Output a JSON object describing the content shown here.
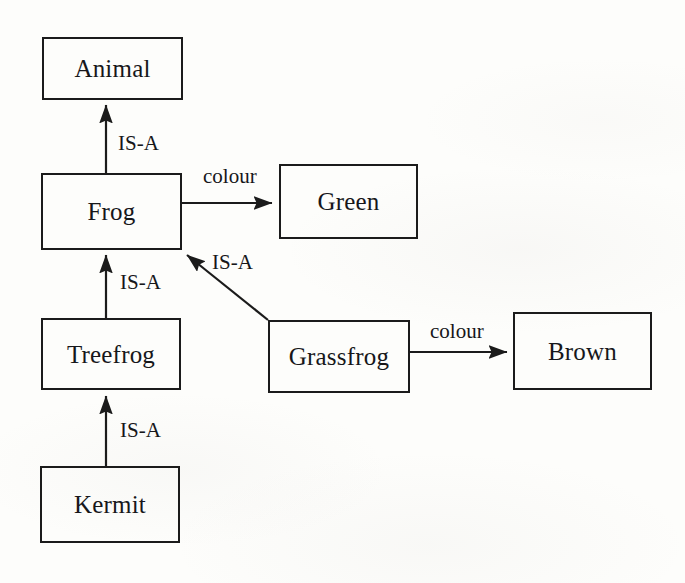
{
  "diagram": {
    "kind": "semantic-network",
    "background_color": "#fdfdfb",
    "line_color": "#1b1b1b",
    "text_color": "#17171a",
    "nodes": [
      {
        "id": "animal",
        "label": "Animal",
        "x": 42,
        "y": 37,
        "w": 141,
        "h": 63
      },
      {
        "id": "frog",
        "label": "Frog",
        "x": 41,
        "y": 173,
        "w": 141,
        "h": 77
      },
      {
        "id": "green",
        "label": "Green",
        "x": 279,
        "y": 164,
        "w": 139,
        "h": 75
      },
      {
        "id": "treefrog",
        "label": "Treefrog",
        "x": 41,
        "y": 318,
        "w": 140,
        "h": 72
      },
      {
        "id": "grassfrog",
        "label": "Grassfrog",
        "x": 268,
        "y": 320,
        "w": 142,
        "h": 73
      },
      {
        "id": "brown",
        "label": "Brown",
        "x": 513,
        "y": 312,
        "w": 139,
        "h": 78
      },
      {
        "id": "kermit",
        "label": "Kermit",
        "x": 40,
        "y": 466,
        "w": 140,
        "h": 77
      }
    ],
    "edges": [
      {
        "id": "frog-isa-animal",
        "from": "frog",
        "to": "animal",
        "label": "IS-A",
        "label_x": 118,
        "label_y": 133
      },
      {
        "id": "treefrog-isa-frog",
        "from": "treefrog",
        "to": "frog",
        "label": "IS-A",
        "label_x": 120,
        "label_y": 272
      },
      {
        "id": "kermit-isa-treefrog",
        "from": "kermit",
        "to": "treefrog",
        "label": "IS-A",
        "label_x": 120,
        "label_y": 420
      },
      {
        "id": "grassfrog-isa-frog",
        "from": "grassfrog",
        "to": "frog",
        "label": "IS-A",
        "label_x": 212,
        "label_y": 252
      },
      {
        "id": "frog-colour-green",
        "from": "frog",
        "to": "green",
        "label": "colour",
        "label_x": 203,
        "label_y": 166
      },
      {
        "id": "grassfrog-colour-brown",
        "from": "grassfrog",
        "to": "brown",
        "label": "colour",
        "label_x": 430,
        "label_y": 321
      }
    ]
  }
}
